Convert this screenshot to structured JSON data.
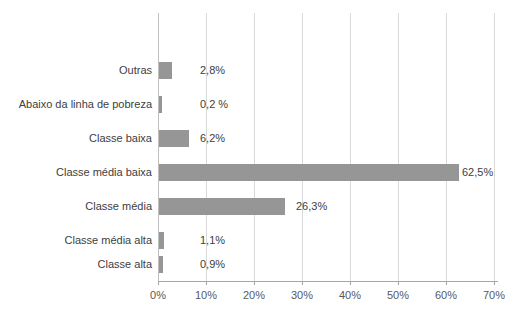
{
  "chart_data": {
    "type": "bar",
    "orientation": "horizontal",
    "title": "",
    "subtitle": "",
    "xlabel": "",
    "ylabel": "",
    "categories": [
      "Outras",
      "Abaixo da linha de pobreza",
      "Classe baixa",
      "Classe média baixa",
      "Classe média",
      "Classe média alta",
      "Classe alta"
    ],
    "values": [
      2.8,
      0.2,
      6.2,
      62.5,
      26.3,
      1.1,
      0.9
    ],
    "value_labels": [
      "2,8%",
      "0,2 %",
      "6,2%",
      "62,5%",
      "26,3%",
      "1,1%",
      "0,9%"
    ],
    "xlim": [
      0,
      70
    ],
    "xticks": [
      0,
      10,
      20,
      30,
      40,
      50,
      60,
      70
    ],
    "xtick_labels": [
      "0%",
      "10%",
      "20%",
      "30%",
      "40%",
      "50%",
      "60%",
      "70%"
    ],
    "grid": true,
    "grid_axis": "x",
    "legend": false,
    "legend_position": "none",
    "bar_color": "#969696",
    "gridline_color": "#d9d9d9",
    "axis_color": "#a6a6a6",
    "text_color": "#404040",
    "background_color": "#ffffff"
  }
}
